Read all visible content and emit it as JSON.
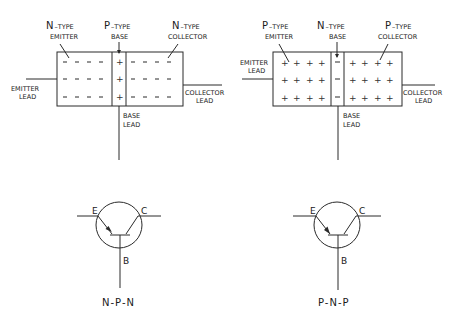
{
  "npn_structure": {
    "emitter": {
      "type_letter": "N",
      "type_suffix": "–TYPE",
      "role": "EMITTER",
      "carrier": "–"
    },
    "base": {
      "type_letter": "P",
      "type_suffix": "–TYPE",
      "role": "BASE",
      "carrier": "+"
    },
    "collector": {
      "type_letter": "N",
      "type_suffix": "–TYPE",
      "role": "COLLECTOR",
      "carrier": "–"
    },
    "leads": {
      "emitter": [
        "EMITTER",
        "LEAD"
      ],
      "collector": [
        "COLLECTOR",
        "LEAD"
      ],
      "base": [
        "BASE",
        "LEAD"
      ]
    }
  },
  "pnp_structure": {
    "emitter": {
      "type_letter": "P",
      "type_suffix": "–TYPE",
      "role": "EMITTER",
      "carrier": "+"
    },
    "base": {
      "type_letter": "N",
      "type_suffix": "–TYPE",
      "role": "BASE",
      "carrier": "–"
    },
    "collector": {
      "type_letter": "P",
      "type_suffix": "–TYPE",
      "role": "COLLECTOR",
      "carrier": "+"
    },
    "leads": {
      "emitter": [
        "EMITTER",
        "LEAD"
      ],
      "collector": [
        "COLLECTOR",
        "LEAD"
      ],
      "base": [
        "BASE",
        "LEAD"
      ]
    }
  },
  "npn_symbol": {
    "terminals": {
      "emitter": "E",
      "collector": "C",
      "base": "B"
    },
    "caption": "N-P-N",
    "arrow_direction": "outward"
  },
  "pnp_symbol": {
    "terminals": {
      "emitter": "E",
      "collector": "C",
      "base": "B"
    },
    "caption": "P-N-P",
    "arrow_direction": "inward"
  }
}
